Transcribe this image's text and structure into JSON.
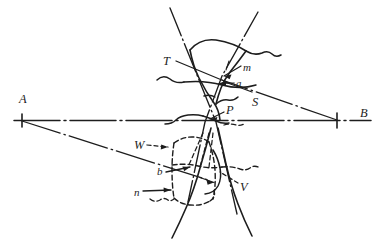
{
  "figure": {
    "kind": "survey-line-diagram",
    "width": 385,
    "height": 252,
    "background_color": "#ffffff",
    "ink_color": "#1d1d1d"
  },
  "labels": {
    "A": {
      "text": "A",
      "x": 19,
      "y": 93,
      "case": "cap"
    },
    "B": {
      "text": "B",
      "x": 360,
      "y": 107,
      "case": "cap"
    },
    "T": {
      "text": "T",
      "x": 163,
      "y": 55,
      "case": "cap"
    },
    "m": {
      "text": "m",
      "x": 243,
      "y": 62,
      "case": "low"
    },
    "a": {
      "text": "a",
      "x": 236,
      "y": 80,
      "case": "low"
    },
    "S": {
      "text": "S",
      "x": 252,
      "y": 96,
      "case": "cap"
    },
    "P": {
      "text": "P",
      "x": 226,
      "y": 108,
      "case": "cap"
    },
    "W": {
      "text": "W",
      "x": 134,
      "y": 141,
      "case": "cap"
    },
    "b": {
      "text": "b",
      "x": 157,
      "y": 170,
      "case": "low"
    },
    "V": {
      "text": "V",
      "x": 240,
      "y": 185,
      "case": "cap"
    },
    "n": {
      "text": "n",
      "x": 134,
      "y": 190,
      "case": "low"
    }
  },
  "baseline": {
    "name": "A-B baseline",
    "y": 120,
    "x_start": 14,
    "x_end": 371,
    "tick_A_x": 22,
    "tick_B_x": 337,
    "style": "dash-dot"
  },
  "axes": {
    "station_count": 2,
    "endpoint_ticks": 2
  },
  "curve_styles": {
    "solid": "solid",
    "dashed": "dashed",
    "dash_dot": "dash-dot"
  }
}
